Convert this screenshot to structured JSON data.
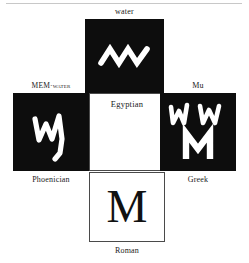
{
  "figure": {
    "title_visible": false,
    "background_color": "#ffffff",
    "dark_panel_color": "#0d0d0d",
    "light_panel_color": "#ffffff",
    "glyph_color": "#ffffff",
    "text_color": "#1a1a1a"
  },
  "panels": {
    "top": {
      "caption": "water",
      "caption_position": "above",
      "style": "dark",
      "glyph_name": "egyptian-water-zigzag",
      "glyph_description": "white three-peak zigzag wave"
    },
    "left": {
      "caption": "MEM·water",
      "caption_position": "above",
      "style": "dark",
      "glyph_name": "phoenician-mem",
      "glyph_description": "white angular mem with long descending right stroke",
      "sub_caption": "Phoenician"
    },
    "center": {
      "caption": "Egyptian",
      "caption_position": "inside-top",
      "style": "light",
      "glyph_name": "none",
      "glyph_description": "empty white square"
    },
    "right": {
      "caption": "Mu",
      "caption_position": "above",
      "style": "dark",
      "glyph_name": "greek-mu-variants",
      "glyph_description": "two archaic zigzag mu forms above a bold capital M",
      "sub_caption": "Greek"
    },
    "bottom": {
      "caption": "Roman",
      "caption_position": "below",
      "style": "light",
      "glyph_name": "roman-capital-m",
      "glyph_description": "serif capital M",
      "letter": "M"
    }
  }
}
